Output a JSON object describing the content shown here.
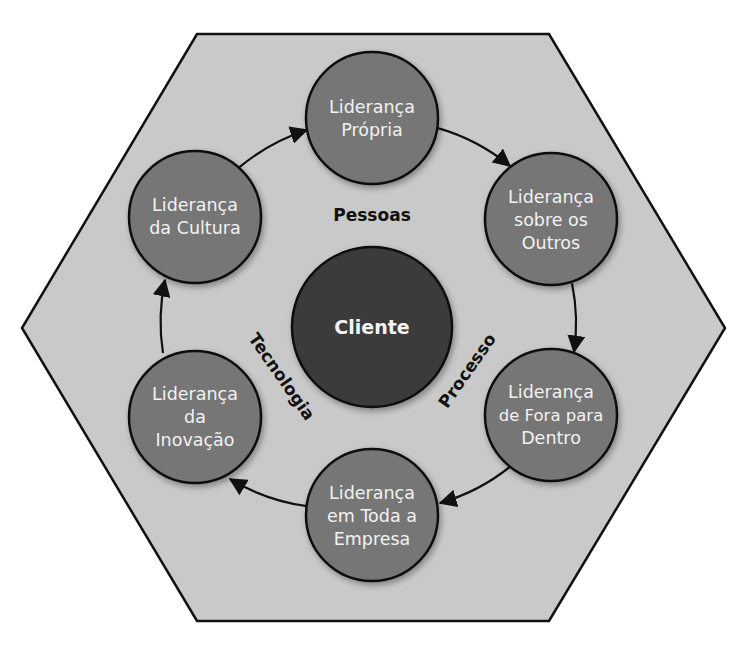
{
  "diagram": {
    "colors": {
      "hexagon_fill": "#c9c9c9",
      "hexagon_stroke": "#111111",
      "node_fill": "#767676",
      "center_fill": "#3b3b3b",
      "node_text": "#f2f2f2",
      "label_text": "#111111",
      "arrow": "#111111"
    },
    "center": {
      "label": "Cliente"
    },
    "dimensions": {
      "people": "Pessoas",
      "technology": "Tecnologia",
      "process": "Processo"
    },
    "nodes": [
      {
        "id": "top",
        "lines": [
          "Liderança",
          "Própria"
        ]
      },
      {
        "id": "upper-right",
        "lines": [
          "Liderança",
          "sobre os",
          "Outros"
        ]
      },
      {
        "id": "lower-right",
        "lines": [
          "Liderança",
          "de Fora para",
          "Dentro"
        ]
      },
      {
        "id": "bottom",
        "lines": [
          "Liderança",
          "em Toda a",
          "Empresa"
        ]
      },
      {
        "id": "lower-left",
        "lines": [
          "Liderança",
          "da",
          "Inovação"
        ]
      },
      {
        "id": "upper-left",
        "lines": [
          "Liderança",
          "da Cultura"
        ]
      }
    ],
    "flow": [
      {
        "from": "Liderança da Cultura",
        "to": "Liderança Própria"
      },
      {
        "from": "Liderança Própria",
        "to": "Liderança sobre os Outros"
      },
      {
        "from": "Liderança sobre os Outros",
        "to": "Liderança de Fora para Dentro"
      },
      {
        "from": "Liderança de Fora para Dentro",
        "to": "Liderança em Toda a Empresa"
      },
      {
        "from": "Liderança em Toda a Empresa",
        "to": "Liderança da Inovação"
      },
      {
        "from": "Liderança da Inovação",
        "to": "Liderança da Cultura"
      }
    ]
  }
}
